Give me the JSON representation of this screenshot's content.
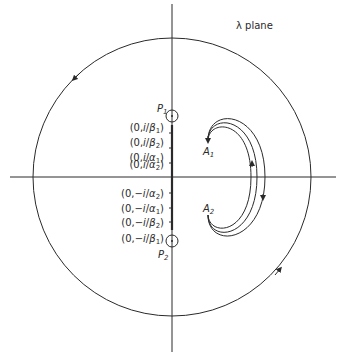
{
  "title": "λ plane",
  "poles": [
    {
      "id": "P1",
      "label": "P",
      "sub": "1"
    },
    {
      "id": "P2",
      "label": "P",
      "sub": "2"
    }
  ],
  "endpoints": [
    {
      "id": "A1",
      "label": "A",
      "sub": "1"
    },
    {
      "id": "A2",
      "label": "A",
      "sub": "2"
    }
  ],
  "axis_labels": [
    {
      "pre": "(0,",
      "num": "i",
      "den": "β",
      "sub": "1",
      "post": ")"
    },
    {
      "pre": "(0,",
      "num": "i",
      "den": "β",
      "sub": "2",
      "post": ")"
    },
    {
      "pre": "(0,",
      "num": "i",
      "den": "α",
      "sub": "1",
      "post": ")"
    },
    {
      "pre": "(0,",
      "num": "i",
      "den": "α",
      "sub": "2",
      "post": ")"
    },
    {
      "pre": "(0,",
      "num": "−i",
      "den": "α",
      "sub": "2",
      "post": ")"
    },
    {
      "pre": "(0,",
      "num": "−i",
      "den": "α",
      "sub": "1",
      "post": ")"
    },
    {
      "pre": "(0,",
      "num": "−i",
      "den": "β",
      "sub": "2",
      "post": ")"
    },
    {
      "pre": "(0,",
      "num": "−i",
      "den": "β",
      "sub": "1",
      "post": ")"
    }
  ],
  "colors": {
    "line": "#2a2a2a",
    "background": "#ffffff"
  }
}
